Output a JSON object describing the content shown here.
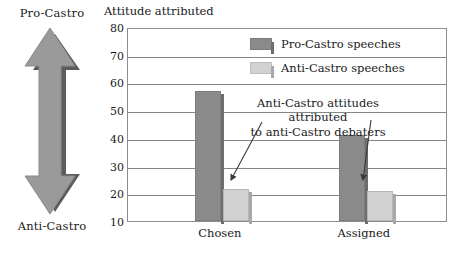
{
  "scale": {
    "top_label": "Pro-Castro",
    "bottom_label": "Anti-Castro",
    "icon": "double-headed-vertical-arrow",
    "fill": "#9a9a9a",
    "shadow": "#5c5c5c"
  },
  "chart_data": {
    "type": "bar",
    "title": "Attitude attributed",
    "xlabel": "",
    "ylabel": "",
    "categories": [
      "Chosen",
      "Assigned"
    ],
    "series": [
      {
        "name": "Pro-Castro speeches",
        "values": [
          57,
          41
        ],
        "color": "#8a8a8a"
      },
      {
        "name": "Anti-Castro speeches",
        "values": [
          21.5,
          21
        ],
        "color": "#d2d2d2"
      }
    ],
    "ylim": [
      10,
      80
    ],
    "yticks": [
      80,
      70,
      60,
      50,
      40,
      30,
      20,
      10
    ],
    "grid": true,
    "legend_position": "top-right",
    "annotations": [
      {
        "text_line1": "Anti-Castro attitudes attributed",
        "text_line2": "to anti-Castro debaters",
        "points_to": [
          "Chosen / Anti-Castro speeches",
          "Assigned / Anti-Castro speeches"
        ]
      }
    ]
  }
}
